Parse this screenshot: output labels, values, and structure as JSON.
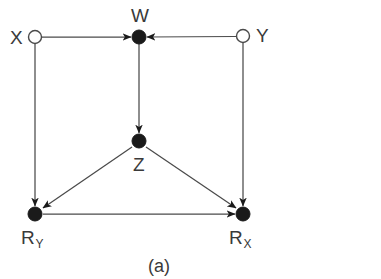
{
  "figure": {
    "caption": "(a)",
    "caption_x": 148,
    "caption_y": 257,
    "width": 381,
    "height": 279,
    "background_color": "#ffffff",
    "stroke_color": "#4a4a4a",
    "filled_node_color": "#1a1a1a",
    "hollow_node_color": "#ffffff",
    "text_color": "#3a3a3a"
  },
  "graph": {
    "type": "directed-acyclic-graph",
    "nodes": [
      {
        "id": "X",
        "label": "X",
        "subscript": "",
        "x": 35,
        "y": 37,
        "radius": 6.5,
        "style": "hollow",
        "label_x": 10,
        "label_y": 28,
        "label_anchor": "left"
      },
      {
        "id": "W",
        "label": "W",
        "subscript": "",
        "x": 139,
        "y": 37,
        "radius": 7,
        "style": "filled",
        "label_x": 131,
        "label_y": 6,
        "label_anchor": "above"
      },
      {
        "id": "Y",
        "label": "Y",
        "subscript": "",
        "x": 243,
        "y": 36,
        "radius": 6.5,
        "style": "hollow",
        "label_x": 256,
        "label_y": 26,
        "label_anchor": "right"
      },
      {
        "id": "Z",
        "label": "Z",
        "subscript": "",
        "x": 139,
        "y": 141,
        "radius": 7,
        "style": "filled",
        "label_x": 133,
        "label_y": 155,
        "label_anchor": "below"
      },
      {
        "id": "RY",
        "label": "R",
        "subscript": "Y",
        "x": 35,
        "y": 214,
        "radius": 7,
        "style": "filled",
        "label_x": 21,
        "label_y": 228,
        "label_anchor": "below"
      },
      {
        "id": "RX",
        "label": "R",
        "subscript": "X",
        "x": 243,
        "y": 214,
        "radius": 7,
        "style": "filled",
        "label_x": 229,
        "label_y": 228,
        "label_anchor": "below"
      }
    ],
    "edges": [
      {
        "from": "X",
        "to": "W",
        "kind": "straight",
        "arrow": true
      },
      {
        "from": "Y",
        "to": "W",
        "kind": "straight",
        "arrow": true
      },
      {
        "from": "W",
        "to": "Z",
        "kind": "straight",
        "arrow": true
      },
      {
        "from": "X",
        "to": "RY",
        "kind": "straight",
        "arrow": true
      },
      {
        "from": "Y",
        "to": "RX",
        "kind": "straight",
        "arrow": true
      },
      {
        "from": "Z",
        "to": "RY",
        "kind": "straight",
        "arrow": true
      },
      {
        "from": "Z",
        "to": "RX",
        "kind": "straight",
        "arrow": true
      },
      {
        "from": "RY",
        "to": "RX",
        "kind": "straight",
        "arrow": true
      }
    ]
  }
}
